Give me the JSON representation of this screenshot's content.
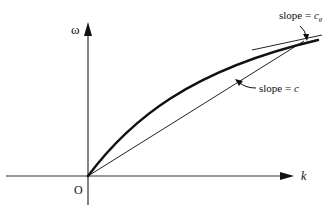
{
  "diagram": {
    "type": "dispersion-relation-sketch",
    "axes": {
      "x_label": "k",
      "y_label": "ω",
      "origin_label": "O"
    },
    "annotations": {
      "group_velocity": {
        "prefix": "slope = ",
        "symbol": "c",
        "subscript": "g"
      },
      "phase_velocity": {
        "prefix": "slope = ",
        "symbol": "c"
      }
    },
    "colors": {
      "ink": "#111111",
      "axis": "#333333",
      "background": "#ffffff"
    }
  }
}
